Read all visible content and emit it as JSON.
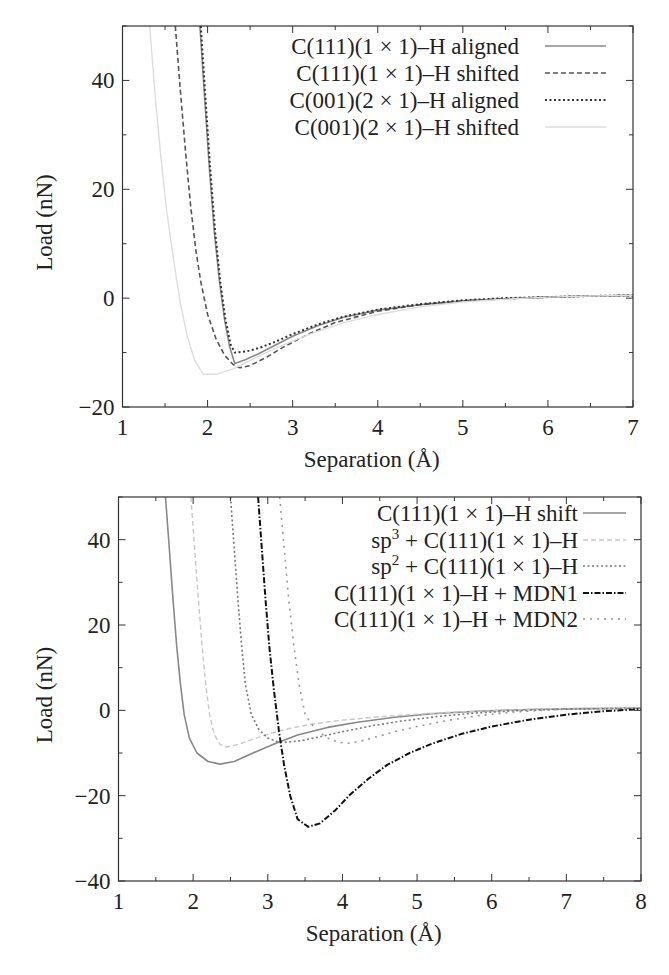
{
  "chart_data": [
    {
      "type": "line",
      "title": "",
      "xlabel": "Separation (Å)",
      "ylabel": "Load (nN)",
      "xlim": [
        1,
        7
      ],
      "ylim": [
        -20,
        50
      ],
      "xticks": [
        1,
        2,
        3,
        4,
        5,
        6,
        7
      ],
      "yticks": [
        -20,
        0,
        20,
        40
      ],
      "grid": false,
      "legend_position": "top-right",
      "frame": {
        "left": 122.5,
        "right": 633,
        "top": 26,
        "bottom": 407
      },
      "legend": {
        "text_right": 519,
        "line_x1": 545,
        "line_x2": 606,
        "row_y": [
          46,
          73,
          100,
          127
        ]
      },
      "series": [
        {
          "name": "C(111)(1 × 1)–H aligned",
          "style": "solid",
          "color": "#8a8a8a",
          "width": 1.6,
          "x": [
            1.91,
            1.96,
            2.02,
            2.08,
            2.14,
            2.2,
            2.26,
            2.32,
            2.45,
            2.6,
            2.8,
            3.0,
            3.3,
            3.6,
            4.0,
            4.5,
            5.0,
            5.5,
            6.0,
            6.5,
            7.0
          ],
          "y": [
            50,
            38,
            24,
            12,
            3,
            -4,
            -9,
            -12.0,
            -11.3,
            -10.2,
            -8.6,
            -7.0,
            -5.0,
            -3.5,
            -2.2,
            -1.2,
            -0.5,
            -0.1,
            0.2,
            0.4,
            0.5
          ]
        },
        {
          "name": "C(111)(1 × 1)–H shifted",
          "style": "dashed",
          "color": "#555555",
          "width": 1.6,
          "x": [
            1.62,
            1.68,
            1.74,
            1.8,
            1.86,
            1.92,
            2.0,
            2.1,
            2.2,
            2.3,
            2.38,
            2.5,
            2.7,
            2.9,
            3.2,
            3.5,
            4.0,
            4.5,
            5.0,
            5.5,
            6.0,
            6.5,
            7.0
          ],
          "y": [
            50,
            38,
            27,
            17,
            9,
            3,
            -3,
            -7.5,
            -10.5,
            -12.2,
            -12.8,
            -12.4,
            -10.8,
            -8.9,
            -6.5,
            -4.5,
            -2.4,
            -1.2,
            -0.5,
            -0.1,
            0.2,
            0.4,
            0.5
          ]
        },
        {
          "name": "C(001)(2 × 1)–H aligned",
          "style": "dotted",
          "color": "#333333",
          "width": 2.0,
          "x": [
            1.92,
            1.97,
            2.03,
            2.09,
            2.15,
            2.21,
            2.27,
            2.32,
            2.45,
            2.6,
            2.8,
            3.0,
            3.3,
            3.6,
            4.0,
            4.5,
            5.0,
            5.5,
            6.0,
            6.5,
            7.0
          ],
          "y": [
            50,
            38,
            24,
            12,
            3,
            -4,
            -8.5,
            -10.0,
            -9.8,
            -9.2,
            -8.0,
            -6.6,
            -4.8,
            -3.4,
            -2.1,
            -1.1,
            -0.4,
            0.0,
            0.2,
            0.4,
            0.5
          ]
        },
        {
          "name": "C(001)(2 × 1)–H shifted",
          "style": "solid",
          "color": "#dddddd",
          "width": 1.4,
          "x": [
            1.32,
            1.38,
            1.45,
            1.52,
            1.6,
            1.68,
            1.76,
            1.85,
            1.95,
            2.1,
            2.3,
            2.5,
            2.8,
            3.2,
            3.6,
            4.0,
            4.5,
            5.0,
            5.5,
            6.0,
            6.5,
            7.0
          ],
          "y": [
            50,
            38,
            26,
            16,
            7,
            -1,
            -7,
            -11.5,
            -14.0,
            -14.0,
            -13.0,
            -11.5,
            -9.2,
            -6.6,
            -4.5,
            -3.0,
            -1.6,
            -0.7,
            -0.2,
            0.2,
            0.4,
            0.5
          ]
        }
      ]
    },
    {
      "type": "line",
      "title": "",
      "xlabel": "Separation (Å)",
      "ylabel": "Load (nN)",
      "xlim": [
        1,
        8
      ],
      "ylim": [
        -40,
        50
      ],
      "xticks": [
        1,
        2,
        3,
        4,
        5,
        6,
        7,
        8
      ],
      "yticks": [
        -40,
        -20,
        0,
        20,
        40
      ],
      "grid": false,
      "legend_position": "top-right",
      "frame": {
        "left": 118.5,
        "right": 641,
        "top": 497,
        "bottom": 881
      },
      "legend": {
        "text_right": 578,
        "line_x1": 583,
        "line_x2": 626,
        "row_y": [
          513,
          540,
          566,
          593,
          619
        ]
      },
      "series": [
        {
          "name": "C(111)(1 × 1)–H shift",
          "style": "solid",
          "color": "#888888",
          "width": 1.6,
          "x": [
            1.63,
            1.68,
            1.73,
            1.78,
            1.83,
            1.88,
            1.95,
            2.05,
            2.2,
            2.36,
            2.55,
            2.8,
            3.1,
            3.4,
            3.8,
            4.2,
            4.7,
            5.2,
            5.8,
            6.5,
            7.2,
            8.0
          ],
          "y": [
            50,
            38,
            26,
            15,
            6,
            -1,
            -6.5,
            -10,
            -12,
            -12.6,
            -12.0,
            -10.0,
            -7.8,
            -5.8,
            -4.0,
            -2.8,
            -1.6,
            -0.8,
            -0.2,
            0.2,
            0.4,
            0.5
          ]
        },
        {
          "name": "sp³ + C(111)(1 × 1)–H",
          "style": "dashed",
          "color": "#c8c8c8",
          "width": 1.4,
          "x": [
            1.97,
            2.02,
            2.07,
            2.12,
            2.17,
            2.22,
            2.28,
            2.36,
            2.45,
            2.6,
            2.8,
            3.0,
            3.3,
            3.6,
            4.0,
            4.5,
            5.0,
            5.5,
            6.0,
            6.5,
            7.0,
            8.0
          ],
          "y": [
            50,
            38,
            26,
            15,
            6,
            -1,
            -5.5,
            -8.0,
            -8.6,
            -8.0,
            -6.8,
            -5.6,
            -4.2,
            -3.2,
            -2.3,
            -1.5,
            -0.9,
            -0.4,
            -0.1,
            0.2,
            0.4,
            0.5
          ]
        },
        {
          "name": "sp² + C(111)(1 × 1)–H",
          "style": "dotted",
          "color": "#777777",
          "width": 1.6,
          "x": [
            2.5,
            2.55,
            2.6,
            2.65,
            2.7,
            2.78,
            2.88,
            3.0,
            3.12,
            3.26,
            3.45,
            3.7,
            4.0,
            4.4,
            4.8,
            5.3,
            5.8,
            6.3,
            7.0,
            8.0
          ],
          "y": [
            50,
            38,
            26,
            15,
            6,
            -1,
            -4.5,
            -6.5,
            -7.3,
            -7.5,
            -7.1,
            -6.2,
            -5.0,
            -3.6,
            -2.5,
            -1.4,
            -0.6,
            -0.1,
            0.3,
            0.5
          ]
        },
        {
          "name": "C(111)(1 × 1)–H + MDN1",
          "style": "dashdot",
          "color": "#111111",
          "width": 2.0,
          "x": [
            2.87,
            2.92,
            2.97,
            3.02,
            3.08,
            3.15,
            3.22,
            3.3,
            3.4,
            3.54,
            3.7,
            3.9,
            4.1,
            4.35,
            4.6,
            4.9,
            5.2,
            5.6,
            6.0,
            6.5,
            7.0,
            7.5,
            8.0
          ],
          "y": [
            50,
            38,
            26,
            15,
            5,
            -5,
            -13,
            -20,
            -25.5,
            -27.3,
            -26.5,
            -23.5,
            -19.8,
            -16.0,
            -12.8,
            -10.0,
            -7.8,
            -5.5,
            -3.8,
            -2.2,
            -1.0,
            -0.2,
            0.3
          ]
        },
        {
          "name": "C(111)(1 × 1)–H + MDN2",
          "style": "loose-dotted",
          "color": "#999999",
          "width": 1.6,
          "x": [
            3.16,
            3.22,
            3.28,
            3.35,
            3.42,
            3.5,
            3.6,
            3.72,
            3.85,
            4.0,
            4.07,
            4.2,
            4.4,
            4.7,
            5.0,
            5.4,
            5.8,
            6.3,
            7.0,
            8.0
          ],
          "y": [
            50,
            38,
            26,
            15,
            6,
            -1,
            -3.5,
            -5.5,
            -7.0,
            -7.6,
            -7.7,
            -7.4,
            -6.5,
            -5.0,
            -3.8,
            -2.4,
            -1.3,
            -0.4,
            0.3,
            0.5
          ]
        }
      ]
    }
  ]
}
